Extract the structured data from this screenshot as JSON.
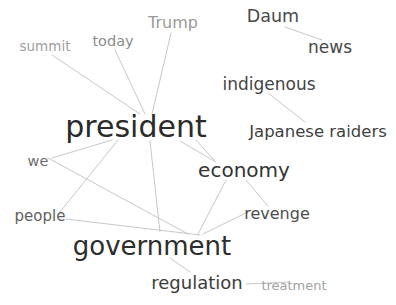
{
  "graph": {
    "title": "Word co-occurrence network",
    "type": "network",
    "width": 396,
    "height": 305,
    "background_color": "#ffffff",
    "edge_color": "#b9b9b9",
    "edge_width": 0.8,
    "nodes": [
      {
        "id": "summit",
        "label": "summit",
        "x": 45,
        "y": 47,
        "font_size": 13.5,
        "color": "#9e9e9e"
      },
      {
        "id": "today",
        "label": "today",
        "x": 113,
        "y": 41,
        "font_size": 14.5,
        "color": "#8d8d8d"
      },
      {
        "id": "trump",
        "label": "Trump",
        "x": 173,
        "y": 23,
        "font_size": 16,
        "color": "#9a9a9a"
      },
      {
        "id": "daum",
        "label": "Daum",
        "x": 273,
        "y": 17,
        "font_size": 17.5,
        "color": "#4a4a4a"
      },
      {
        "id": "news",
        "label": "news",
        "x": 330,
        "y": 47,
        "font_size": 17,
        "color": "#474747"
      },
      {
        "id": "indigenous",
        "label": "indigenous",
        "x": 269,
        "y": 84,
        "font_size": 17,
        "color": "#454545"
      },
      {
        "id": "president",
        "label": "president",
        "x": 136,
        "y": 127,
        "font_size": 30,
        "color": "#2b2b2b"
      },
      {
        "id": "japanese_raiders",
        "label": "Japanese raiders",
        "x": 318,
        "y": 132,
        "font_size": 16.5,
        "color": "#3f3f3f"
      },
      {
        "id": "we",
        "label": "we",
        "x": 38,
        "y": 161,
        "font_size": 14.5,
        "color": "#6e6e6e"
      },
      {
        "id": "economy",
        "label": "economy",
        "x": 244,
        "y": 170,
        "font_size": 20,
        "color": "#333333"
      },
      {
        "id": "people",
        "label": "people",
        "x": 40,
        "y": 216,
        "font_size": 15,
        "color": "#5f5f5f"
      },
      {
        "id": "revenge",
        "label": "revenge",
        "x": 277,
        "y": 214,
        "font_size": 16,
        "color": "#4d4d4d"
      },
      {
        "id": "government",
        "label": "government",
        "x": 152,
        "y": 246,
        "font_size": 26,
        "color": "#2d2d2d"
      },
      {
        "id": "regulation",
        "label": "regulation",
        "x": 197,
        "y": 283,
        "font_size": 18,
        "color": "#3c3c3c"
      },
      {
        "id": "treatment",
        "label": "treatment",
        "x": 294,
        "y": 285,
        "font_size": 13,
        "color": "#a2a2a2"
      }
    ],
    "edges": [
      {
        "source": "summit",
        "target": "president",
        "x1": 52,
        "y1": 55,
        "x2": 140,
        "y2": 114
      },
      {
        "source": "today",
        "target": "president",
        "x1": 115,
        "y1": 50,
        "x2": 145,
        "y2": 114
      },
      {
        "source": "trump",
        "target": "president",
        "x1": 171,
        "y1": 33,
        "x2": 152,
        "y2": 114
      },
      {
        "source": "president",
        "target": "we",
        "x1": 112,
        "y1": 140,
        "x2": 52,
        "y2": 158
      },
      {
        "source": "president",
        "target": "people",
        "x1": 118,
        "y1": 140,
        "x2": 60,
        "y2": 212
      },
      {
        "source": "president",
        "target": "government",
        "x1": 150,
        "y1": 141,
        "x2": 160,
        "y2": 232
      },
      {
        "source": "president",
        "target": "economy",
        "x1": 180,
        "y1": 141,
        "x2": 216,
        "y2": 162
      },
      {
        "source": "we",
        "target": "government",
        "x1": 48,
        "y1": 158,
        "x2": 188,
        "y2": 234
      },
      {
        "source": "people",
        "target": "government",
        "x1": 66,
        "y1": 219,
        "x2": 200,
        "y2": 235
      },
      {
        "source": "government",
        "target": "economy",
        "x1": 198,
        "y1": 234,
        "x2": 226,
        "y2": 180
      },
      {
        "source": "government",
        "target": "revenge",
        "x1": 203,
        "y1": 234,
        "x2": 252,
        "y2": 210
      },
      {
        "source": "government",
        "target": "regulation",
        "x1": 170,
        "y1": 258,
        "x2": 190,
        "y2": 272
      },
      {
        "source": "economy",
        "target": "revenge",
        "x1": 246,
        "y1": 180,
        "x2": 268,
        "y2": 206
      },
      {
        "source": "daum",
        "target": "news",
        "x1": 285,
        "y1": 27,
        "x2": 322,
        "y2": 40
      },
      {
        "source": "indigenous",
        "target": "japanese_raiders",
        "x1": 268,
        "y1": 93,
        "x2": 305,
        "y2": 122
      },
      {
        "source": "regulation",
        "target": "treatment",
        "x1": 246,
        "y1": 284,
        "x2": 288,
        "y2": 282
      },
      {
        "source": "economy",
        "target": "president",
        "x1": 214,
        "y1": 160,
        "x2": 196,
        "y2": 140
      }
    ]
  }
}
